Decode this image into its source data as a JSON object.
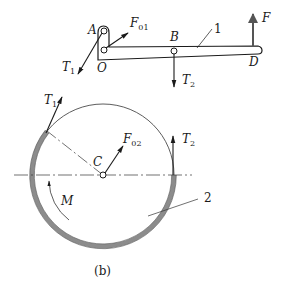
{
  "figure": {
    "caption": "(b)"
  },
  "lever": {
    "part_number": "1",
    "points": {
      "A": "A",
      "O": "O",
      "B": "B",
      "D": "D"
    },
    "forces": {
      "F01": {
        "symbol": "F",
        "subscript": "01"
      },
      "T1": {
        "symbol": "T",
        "subscript": "1"
      },
      "T2": {
        "symbol": "T",
        "subscript": "2"
      },
      "F": {
        "symbol": "F",
        "subscript": ""
      }
    }
  },
  "drum": {
    "part_number": "2",
    "center": "C",
    "moment": "M",
    "forces": {
      "T1": {
        "symbol": "T",
        "subscript": "1"
      },
      "T2": {
        "symbol": "T",
        "subscript": "2"
      },
      "F02": {
        "symbol": "F",
        "subscript": "02"
      }
    }
  },
  "colors": {
    "line": "#1a1a1a",
    "belt_fill": "#8c8c8c",
    "thin_line": "#555555"
  }
}
